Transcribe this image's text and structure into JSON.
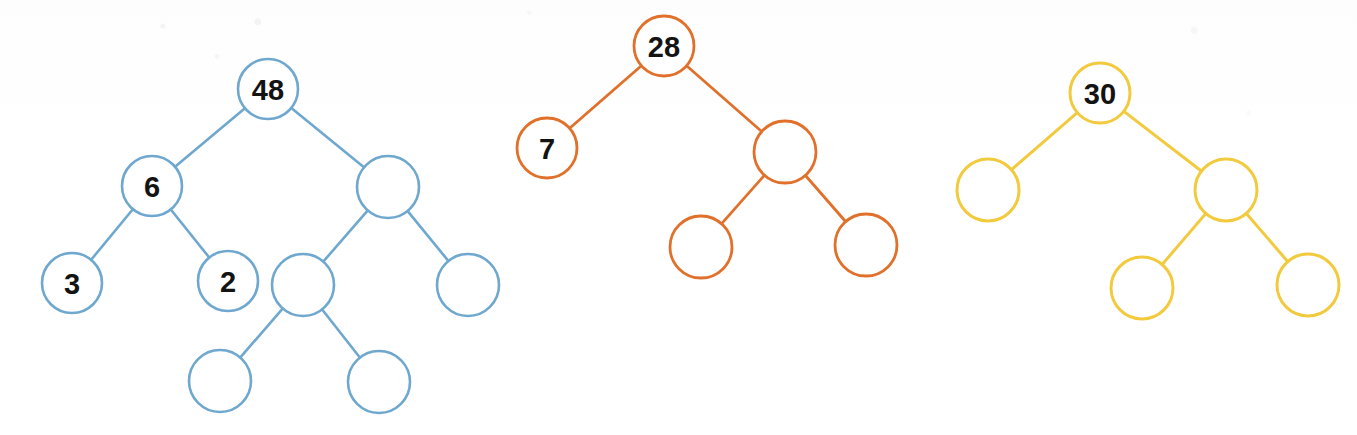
{
  "figure": {
    "background_color": "#fefefe",
    "width": 1357,
    "height": 435
  },
  "chart_data": {
    "type": "diagram",
    "trees": [
      {
        "name": "blue-tree",
        "color": "#6fa8cf",
        "stroke_width": 2.6,
        "root_label": "48",
        "node_count": 10,
        "labeled_nodes": [
          "48",
          "6",
          "3",
          "2"
        ],
        "nodes": [
          {
            "id": "b1",
            "label": "48",
            "cx": 268,
            "cy": 89,
            "r": 30
          },
          {
            "id": "b2",
            "label": "6",
            "cx": 152,
            "cy": 186,
            "r": 30
          },
          {
            "id": "b3",
            "label": "",
            "cx": 388,
            "cy": 187,
            "r": 31
          },
          {
            "id": "b4",
            "label": "3",
            "cx": 72,
            "cy": 283,
            "r": 30
          },
          {
            "id": "b5",
            "label": "2",
            "cx": 228,
            "cy": 281,
            "r": 30
          },
          {
            "id": "b6",
            "label": "",
            "cx": 303,
            "cy": 285,
            "r": 31
          },
          {
            "id": "b7",
            "label": "",
            "cx": 468,
            "cy": 285,
            "r": 31
          },
          {
            "id": "b8",
            "label": "",
            "cx": 220,
            "cy": 381,
            "r": 31
          },
          {
            "id": "b9",
            "label": "",
            "cx": 379,
            "cy": 382,
            "r": 31
          }
        ],
        "edges": [
          {
            "from": "b1",
            "to": "b2"
          },
          {
            "from": "b1",
            "to": "b3"
          },
          {
            "from": "b2",
            "to": "b4"
          },
          {
            "from": "b2",
            "to": "b5"
          },
          {
            "from": "b3",
            "to": "b6"
          },
          {
            "from": "b3",
            "to": "b7"
          },
          {
            "from": "b6",
            "to": "b8"
          },
          {
            "from": "b6",
            "to": "b9"
          }
        ]
      },
      {
        "name": "orange-tree",
        "color": "#e1702a",
        "stroke_width": 2.8,
        "root_label": "28",
        "node_count": 5,
        "labeled_nodes": [
          "28",
          "7"
        ],
        "nodes": [
          {
            "id": "o1",
            "label": "28",
            "cx": 664,
            "cy": 46,
            "r": 30
          },
          {
            "id": "o2",
            "label": "7",
            "cx": 547,
            "cy": 148,
            "r": 30
          },
          {
            "id": "o3",
            "label": "",
            "cx": 785,
            "cy": 152,
            "r": 31
          },
          {
            "id": "o4",
            "label": "",
            "cx": 701,
            "cy": 247,
            "r": 31
          },
          {
            "id": "o5",
            "label": "",
            "cx": 866,
            "cy": 245,
            "r": 31
          }
        ],
        "edges": [
          {
            "from": "o1",
            "to": "o2"
          },
          {
            "from": "o1",
            "to": "o3"
          },
          {
            "from": "o3",
            "to": "o4"
          },
          {
            "from": "o3",
            "to": "o5"
          }
        ]
      },
      {
        "name": "yellow-tree",
        "color": "#f2ca3e",
        "stroke_width": 3.0,
        "root_label": "30",
        "node_count": 5,
        "labeled_nodes": [
          "30"
        ],
        "nodes": [
          {
            "id": "y1",
            "label": "30",
            "cx": 1100,
            "cy": 93,
            "r": 30
          },
          {
            "id": "y2",
            "label": "",
            "cx": 988,
            "cy": 190,
            "r": 31
          },
          {
            "id": "y3",
            "label": "",
            "cx": 1226,
            "cy": 190,
            "r": 31
          },
          {
            "id": "y4",
            "label": "",
            "cx": 1142,
            "cy": 288,
            "r": 31
          },
          {
            "id": "y5",
            "label": "",
            "cx": 1308,
            "cy": 285,
            "r": 31
          }
        ],
        "edges": [
          {
            "from": "y1",
            "to": "y2"
          },
          {
            "from": "y1",
            "to": "y3"
          },
          {
            "from": "y3",
            "to": "y4"
          },
          {
            "from": "y3",
            "to": "y5"
          }
        ]
      }
    ]
  }
}
